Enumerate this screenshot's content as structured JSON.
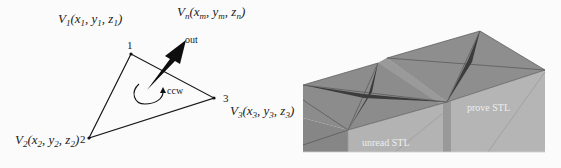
{
  "left_diagram": {
    "title": "STL facet with normal vector",
    "vertices": [
      {
        "id": "1",
        "label_prefix": "V",
        "label_sub": "1",
        "coords": [
          "x",
          "1",
          "y",
          "1",
          "z",
          "1"
        ],
        "x": 131,
        "y": 54
      },
      {
        "id": "2",
        "label_prefix": "V",
        "label_sub": "2",
        "coords": [
          "x",
          "2",
          "y",
          "2",
          "z",
          "2"
        ],
        "x": 89,
        "y": 138
      },
      {
        "id": "3",
        "label_prefix": "V",
        "label_sub": "3",
        "coords": [
          "x",
          "3",
          "y",
          "3",
          "z",
          "3"
        ],
        "x": 214,
        "y": 98
      }
    ],
    "normal": {
      "prefix": "V",
      "sub": "n",
      "coords": [
        "x",
        "m",
        "y",
        "m",
        "z",
        "n"
      ]
    },
    "labels": {
      "v1": "1",
      "v2": "2",
      "v3": "3",
      "out": "out",
      "ccw": "ccw"
    },
    "colors": {
      "line": "#1a1a1a",
      "arrow": "#111111"
    }
  },
  "right_diagram": {
    "title": "3D STL mesh surfaces",
    "labels": {
      "prove": "prove STL",
      "unread": "unread STL"
    },
    "colors": {
      "top_face": "#8a8a8a",
      "side_face": "#b0b0b0",
      "dark_edge": "#3a3a3a",
      "side_dark": "#999999"
    }
  }
}
